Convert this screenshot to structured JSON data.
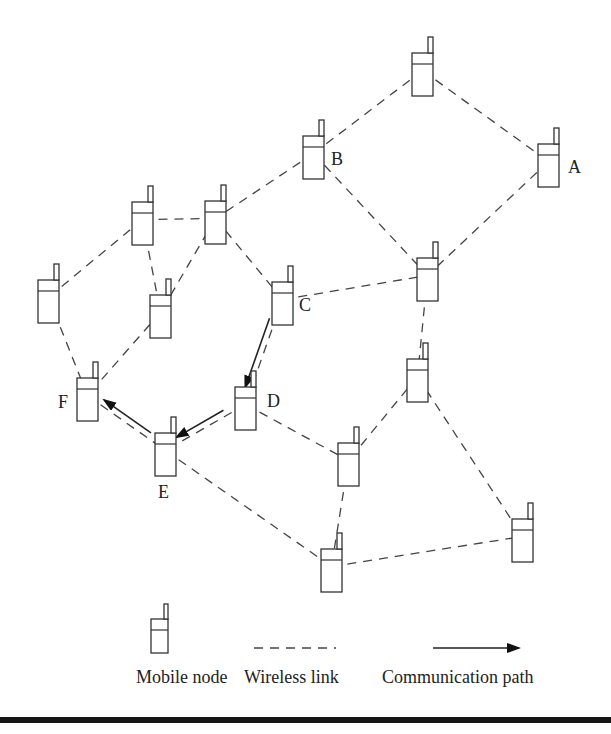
{
  "diagram": {
    "nodes": [
      {
        "id": "n1",
        "label": "",
        "x": 412,
        "y": 53
      },
      {
        "id": "A",
        "label": "A",
        "x": 538,
        "y": 144,
        "lx": 568,
        "ly": 173
      },
      {
        "id": "B",
        "label": "B",
        "x": 303,
        "y": 136,
        "lx": 331,
        "ly": 165
      },
      {
        "id": "n4",
        "label": "",
        "x": 132,
        "y": 202
      },
      {
        "id": "n5",
        "label": "",
        "x": 205,
        "y": 201
      },
      {
        "id": "n6",
        "label": "",
        "x": 38,
        "y": 280
      },
      {
        "id": "n7",
        "label": "",
        "x": 150,
        "y": 295
      },
      {
        "id": "C",
        "label": "C",
        "x": 272,
        "y": 282,
        "lx": 299,
        "ly": 311
      },
      {
        "id": "n9",
        "label": "",
        "x": 417,
        "y": 258
      },
      {
        "id": "n10",
        "label": "",
        "x": 407,
        "y": 359
      },
      {
        "id": "F",
        "label": "F",
        "x": 77,
        "y": 378,
        "lx": 58,
        "ly": 408
      },
      {
        "id": "D",
        "label": "D",
        "x": 235,
        "y": 387,
        "lx": 267,
        "ly": 407
      },
      {
        "id": "E",
        "label": "E",
        "x": 155,
        "y": 433,
        "lx": 158,
        "ly": 498
      },
      {
        "id": "n14",
        "label": "",
        "x": 338,
        "y": 443
      },
      {
        "id": "n15",
        "label": "",
        "x": 321,
        "y": 549
      },
      {
        "id": "n16",
        "label": "",
        "x": 512,
        "y": 519
      }
    ],
    "links": [
      [
        "n1",
        "B"
      ],
      [
        "n1",
        "A"
      ],
      [
        "B",
        "n5"
      ],
      [
        "B",
        "n9"
      ],
      [
        "A",
        "n9"
      ],
      [
        "n4",
        "n5"
      ],
      [
        "n4",
        "n6"
      ],
      [
        "n4",
        "n7"
      ],
      [
        "n5",
        "n7"
      ],
      [
        "n5",
        "C"
      ],
      [
        "C",
        "n9"
      ],
      [
        "n9",
        "n10"
      ],
      [
        "n6",
        "F"
      ],
      [
        "n7",
        "F"
      ],
      [
        "C",
        "D"
      ],
      [
        "D",
        "E"
      ],
      [
        "D",
        "n14"
      ],
      [
        "F",
        "E"
      ],
      [
        "E",
        "n15"
      ],
      [
        "n10",
        "n14"
      ],
      [
        "n10",
        "n16"
      ],
      [
        "n14",
        "n15"
      ],
      [
        "n15",
        "n16"
      ]
    ],
    "communication_path": [
      "C",
      "D",
      "E",
      "F"
    ]
  },
  "legend": {
    "mobile_node_label": "Mobile node",
    "wireless_link_label": "Wireless link",
    "communication_path_label": "Communication path"
  },
  "colors": {
    "line": "#444444",
    "text": "#222222",
    "background": "#ffffff",
    "rule": "#151515"
  }
}
